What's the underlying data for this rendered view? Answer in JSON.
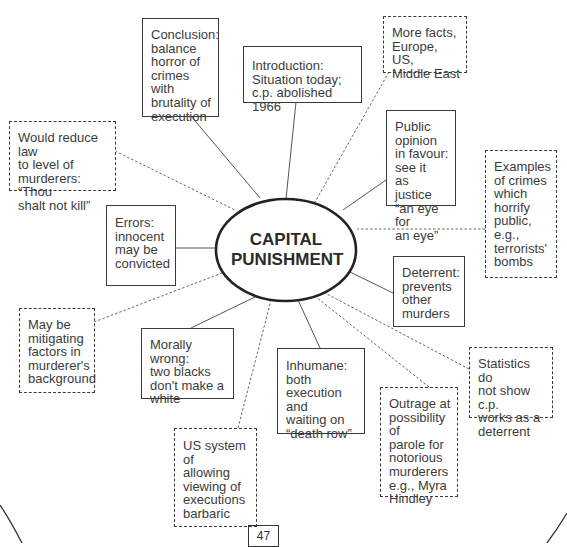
{
  "diagram": {
    "type": "mind-map",
    "center": {
      "label": "CAPITAL PUNISHMENT"
    },
    "legend": {
      "solid_box": "point used in essay plan",
      "dashed_box": "additional / optional point"
    },
    "nodes": [
      {
        "id": "conclusion",
        "style": "solid",
        "text": "Conclusion:\nbalance\nhorror of\ncrimes with\nbrutality of\nexecution"
      },
      {
        "id": "introduction",
        "style": "solid",
        "text": "Introduction:\nSituation today;\nc.p. abolished 1966"
      },
      {
        "id": "more-facts",
        "style": "dashed",
        "text": "More facts,\nEurope, US,\nMiddle East"
      },
      {
        "id": "public-opinion",
        "style": "solid",
        "text": "Public\nopinion\nin favour:\nsee it\nas justice\n“an eye for\nan eye”"
      },
      {
        "id": "examples",
        "style": "dashed",
        "text": "Examples\nof crimes\nwhich\nhorrify\npublic,\ne.g.,\nterrorists'\nbombs"
      },
      {
        "id": "would-reduce",
        "style": "dashed",
        "text": "Would reduce law\nto level of\nmurderers: “Thou\nshalt not kill”"
      },
      {
        "id": "errors",
        "style": "solid",
        "text": "Errors:\ninnocent\nmay be\nconvicted"
      },
      {
        "id": "deterrent",
        "style": "solid",
        "text": "Deterrent:\nprevents\nother\nmurders"
      },
      {
        "id": "mitigating",
        "style": "dashed",
        "text": "May be\nmitigating\nfactors in\nmurderer's\nbackground"
      },
      {
        "id": "morally-wrong",
        "style": "solid",
        "text": "Morally wrong:\ntwo blacks\ndon't make a\nwhite"
      },
      {
        "id": "inhumane",
        "style": "solid",
        "text": "Inhumane:\nboth\nexecution and\nwaiting on\n“death row”"
      },
      {
        "id": "statistics",
        "style": "dashed",
        "text": "Statistics do\nnot show c.p.\nworks as a\ndeterrent"
      },
      {
        "id": "outrage",
        "style": "dashed",
        "text": "Outrage at\npossibility of\nparole for\nnotorious\nmurderers\ne.g., Myra\nHindley"
      },
      {
        "id": "us-system",
        "style": "dashed",
        "text": "US system of\nallowing\nviewing of\nexecutions\nbarbaric"
      }
    ]
  },
  "page": {
    "number": "47"
  },
  "colors": {
    "ink": "#3a3a3a",
    "background": "#ffffff"
  }
}
